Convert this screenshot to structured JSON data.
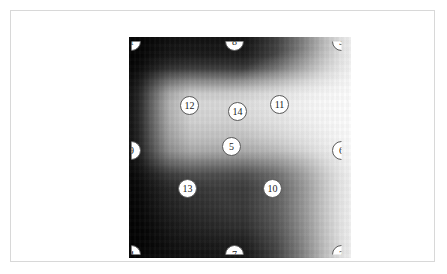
{
  "card": {
    "border_color": "#d8d8d8",
    "background": "#ffffff"
  },
  "figure": {
    "name": "grayscale-gradient-image",
    "marker_fill": "#ffffff",
    "marker_border": "#5a5a5a",
    "marker_text_color": "#1c1c1c"
  },
  "markers": [
    {
      "label": "1",
      "x": 111,
      "y": 21,
      "clip": "clip-tl",
      "position": "top-left-corner"
    },
    {
      "label": "8",
      "x": 214,
      "y": 21,
      "clip": "clip-t",
      "position": "top-center"
    },
    {
      "label": "3",
      "x": 321,
      "y": 21,
      "clip": "clip-tr",
      "position": "top-right-corner"
    },
    {
      "label": "12",
      "x": 169,
      "y": 85,
      "clip": "",
      "position": "upper-left-inner"
    },
    {
      "label": "14",
      "x": 217,
      "y": 91,
      "clip": "",
      "position": "upper-center-inner"
    },
    {
      "label": "11",
      "x": 259,
      "y": 84,
      "clip": "",
      "position": "upper-right-inner"
    },
    {
      "label": "9",
      "x": 111,
      "y": 130,
      "clip": "clip-l",
      "position": "left-middle"
    },
    {
      "label": "5",
      "x": 211,
      "y": 126,
      "clip": "",
      "position": "center"
    },
    {
      "label": "6",
      "x": 321,
      "y": 130,
      "clip": "clip-r",
      "position": "right-middle"
    },
    {
      "label": "13",
      "x": 167,
      "y": 168,
      "clip": "",
      "position": "lower-left-inner"
    },
    {
      "label": "10",
      "x": 252,
      "y": 168,
      "clip": "",
      "position": "lower-right-inner"
    },
    {
      "label": "4",
      "x": 111,
      "y": 234,
      "clip": "clip-bl",
      "position": "bottom-left-corner"
    },
    {
      "label": "7",
      "x": 214,
      "y": 234,
      "clip": "clip-b",
      "position": "bottom-center"
    },
    {
      "label": "2",
      "x": 321,
      "y": 234,
      "clip": "clip-br",
      "position": "bottom-right-corner"
    }
  ],
  "caption": {
    "text": ""
  }
}
